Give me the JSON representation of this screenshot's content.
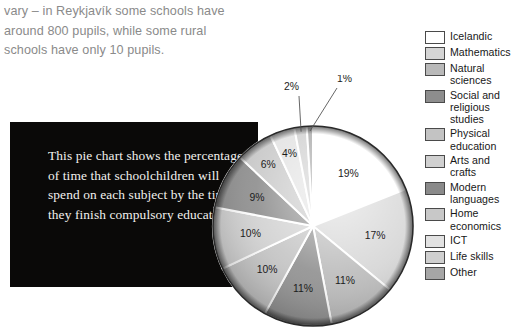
{
  "intro": {
    "text": "vary – in Reykjavík some schools have around 800 pupils, while some rural schools have only 10 pupils."
  },
  "caption": {
    "text": "This pie chart shows the percentage of time that schoolchildren will spend on each subject by the time they finish compulsory education."
  },
  "colors": {
    "icelandic": "#ffffff",
    "mathematics": "#d5d5d5",
    "natural_sciences": "#b9b9b9",
    "social_and_religious_studies": "#8d8d8d",
    "physical_education": "#c3c3c3",
    "arts_and_crafts": "#d0d0d0",
    "modern_languages": "#8a8a8a",
    "home_economics": "#c8c8c8",
    "ict": "#e2e2e2",
    "life_skills": "#cfcfcf",
    "other": "#a6a6a6",
    "outline": "#4a4a4a",
    "caption_bg": "#0a0908",
    "intro_text": "#8a8a8a"
  },
  "legend": {
    "items": [
      {
        "label": "Icelandic",
        "color": "#ffffff"
      },
      {
        "label": "Mathematics",
        "color": "#d5d5d5"
      },
      {
        "label": "Natural sciences",
        "color": "#b9b9b9"
      },
      {
        "label": "Social and religious studies",
        "color": "#8d8d8d"
      },
      {
        "label": "Physical education",
        "color": "#c3c3c3"
      },
      {
        "label": "Arts and crafts",
        "color": "#d0d0d0"
      },
      {
        "label": "Modern languages",
        "color": "#8a8a8a"
      },
      {
        "label": "Home economics",
        "color": "#c8c8c8"
      },
      {
        "label": "ICT",
        "color": "#e2e2e2"
      },
      {
        "label": "Life skills",
        "color": "#cfcfcf"
      },
      {
        "label": "Other",
        "color": "#a6a6a6"
      }
    ]
  },
  "chart_data": {
    "type": "pie",
    "title": "",
    "xlabel": "",
    "ylabel": "",
    "legend_position": "right",
    "grid": false,
    "start_angle_deg": -90,
    "direction": "clockwise",
    "categories": [
      "Icelandic",
      "Mathematics",
      "Natural sciences",
      "Social and religious studies",
      "Physical education",
      "Arts and crafts",
      "Modern languages",
      "Home economics",
      "ICT",
      "Life skills",
      "Other"
    ],
    "values": [
      19,
      17,
      11,
      11,
      10,
      10,
      9,
      6,
      4,
      2,
      1
    ],
    "data_labels": [
      "19%",
      "17%",
      "11%",
      "11%",
      "10%",
      "10%",
      "9%",
      "6%",
      "4%",
      "2%",
      "1%"
    ],
    "colors": [
      "#ffffff",
      "#d5d5d5",
      "#b9b9b9",
      "#8d8d8d",
      "#c3c3c3",
      "#d0d0d0",
      "#8a8a8a",
      "#c8c8c8",
      "#e2e2e2",
      "#cfcfcf",
      "#a6a6a6"
    ],
    "outside_labels": [
      "2%",
      "1%"
    ],
    "total": 100
  }
}
